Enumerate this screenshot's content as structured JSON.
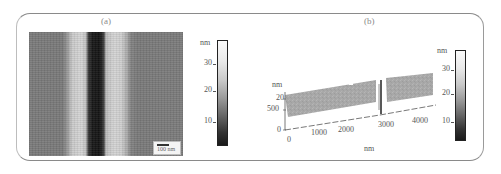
{
  "figure": {
    "panel_a": {
      "label": "(a)",
      "scale_bar": "100 nm",
      "colorbar": {
        "unit": "nm",
        "ticks": [
          "30",
          "20",
          "10"
        ]
      }
    },
    "panel_b": {
      "label": "(b)",
      "z_axis": {
        "unit": "nm",
        "ticks": [
          "20"
        ]
      },
      "y_axis": {
        "ticks": [
          "500",
          "0"
        ]
      },
      "x_axis": {
        "ticks": [
          "0",
          "1000",
          "2000",
          "3000",
          "4000"
        ],
        "label": "nm"
      },
      "colorbar": {
        "unit": "nm",
        "ticks": [
          "30",
          "20",
          "10"
        ]
      }
    },
    "colors": {
      "frame": "#8a8a8a",
      "surface": "#a9a9a9",
      "dark_trench": "#141414"
    }
  }
}
